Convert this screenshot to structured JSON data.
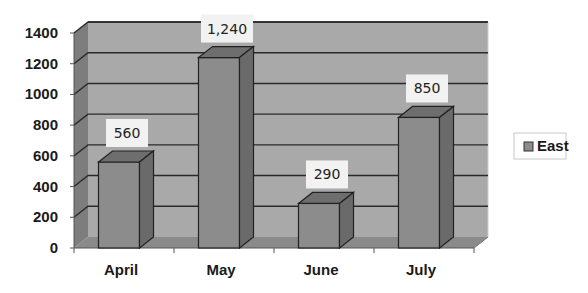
{
  "chart_data": {
    "type": "bar",
    "style": "3d-column",
    "title": "",
    "xlabel": "",
    "ylabel": "",
    "categories": [
      "April",
      "May",
      "June",
      "July"
    ],
    "series": [
      {
        "name": "East",
        "values": [
          560,
          1240,
          290,
          850
        ],
        "labels": [
          "560",
          "1,240",
          "290",
          "850"
        ]
      }
    ],
    "ylim": [
      0,
      1400
    ],
    "yticks": [
      0,
      200,
      400,
      600,
      800,
      1000,
      1200,
      1400
    ],
    "ytick_labels": [
      "0",
      "200",
      "400",
      "600",
      "800",
      "1000",
      "1200",
      "1400"
    ],
    "grid": true,
    "legend": {
      "position": "right",
      "entries": [
        "East"
      ]
    },
    "colors": {
      "bar_front": "#8c8c8c",
      "bar_top": "#6e6e6e",
      "bar_side": "#6a6a6a",
      "wall": "#a9a9a9",
      "side_wall": "#7d7d7d",
      "floor": "#8a8a8a",
      "gridline": "#2a2a2a",
      "label_box": "#f2f2f2"
    }
  }
}
